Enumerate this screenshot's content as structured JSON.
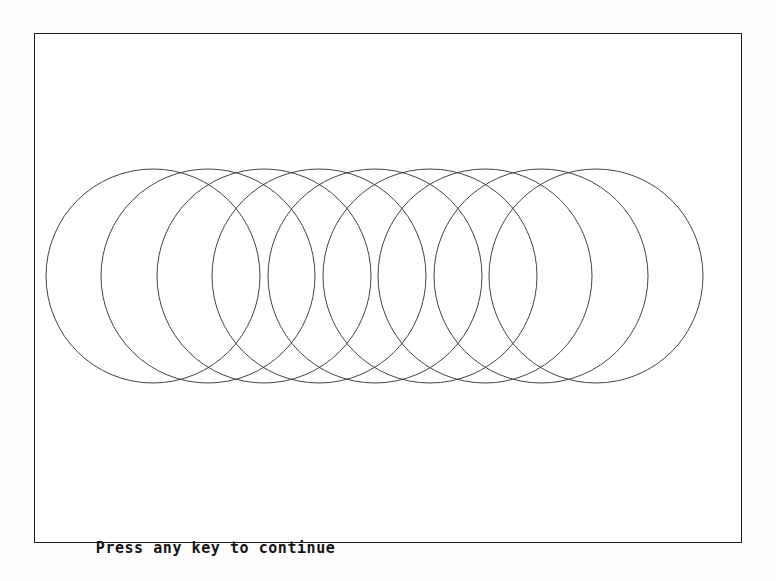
{
  "screen": {
    "width": 776,
    "height": 581,
    "background_color": "#fdfdfd",
    "title": "Circles Demo"
  },
  "frame": {
    "name": "graphics-viewport",
    "x": 34,
    "y": 33,
    "width": 708,
    "height": 510,
    "border_color": "#1d1d1d",
    "border_width": 1.5,
    "fill_color": "#ffffff"
  },
  "drawing": {
    "type": "overlapping-circles",
    "description": "Row of nine evenly spaced overlapping circle outlines",
    "stroke_color": "#454545",
    "stroke_width": 1,
    "fill": "none",
    "radius": 107,
    "center_y": 275,
    "first_center_x": 152,
    "spacing": 55.4,
    "count": 9,
    "centers_x": [
      152,
      207,
      263,
      318,
      374,
      429,
      484,
      540,
      595
    ]
  },
  "prompt": {
    "text": "Press any key to continue",
    "color": "#141414"
  },
  "chart_data": {
    "type": "scatter",
    "xlabel": "",
    "ylabel": "",
    "categories": [
      "c1",
      "c2",
      "c3",
      "c4",
      "c5",
      "c6",
      "c7",
      "c8",
      "c9"
    ],
    "values": [
      107,
      107,
      107,
      107,
      107,
      107,
      107,
      107,
      107
    ],
    "x": [
      152,
      207,
      263,
      318,
      374,
      429,
      484,
      540,
      595
    ],
    "y": [
      275,
      275,
      275,
      275,
      275,
      275,
      275,
      275,
      275
    ],
    "xlim": [
      34,
      742
    ],
    "ylim": [
      33,
      543
    ],
    "grid": false,
    "legend": "none"
  }
}
